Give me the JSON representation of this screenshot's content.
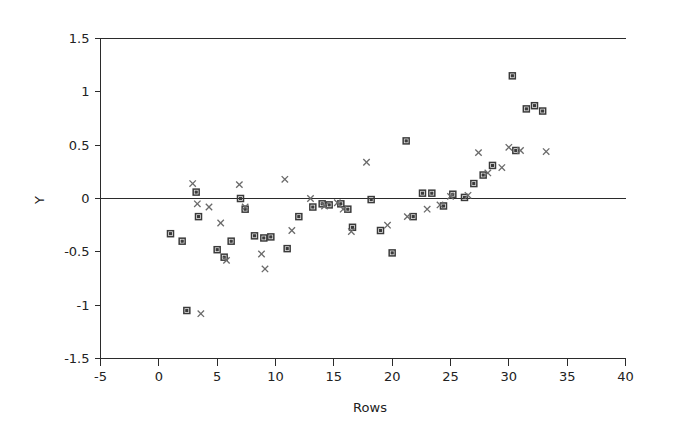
{
  "chart_data": {
    "type": "scatter",
    "title": "",
    "xlabel": "Rows",
    "ylabel": "Y",
    "xlim": [
      -5,
      40
    ],
    "ylim": [
      -1.5,
      1.5
    ],
    "xticks": [
      -5,
      0,
      5,
      10,
      15,
      20,
      25,
      30,
      35,
      40
    ],
    "xtick_labels": [
      "-5",
      "0",
      "5",
      "10",
      "15",
      "20",
      "25",
      "30",
      "35",
      "40"
    ],
    "yticks": [
      -1.5,
      -1,
      -0.5,
      0,
      0.5,
      1,
      1.5
    ],
    "ytick_labels": [
      "-1.5",
      "-1",
      "-0.5",
      "0",
      "0.5",
      "1",
      "1.5"
    ],
    "grid": false,
    "legend": "none",
    "reference_lines": [
      {
        "axis": "y",
        "value": 0,
        "style": "solid",
        "color": "#2b2b2b"
      }
    ],
    "marker_colors": {
      "square": "#3a3a3a",
      "cross": "#6a6a6a"
    },
    "series": [
      {
        "name": "squares",
        "marker": "square",
        "points": [
          [
            1.0,
            -0.33
          ],
          [
            2.0,
            -0.4
          ],
          [
            2.4,
            -1.05
          ],
          [
            3.2,
            0.06
          ],
          [
            3.4,
            -0.17
          ],
          [
            5.0,
            -0.48
          ],
          [
            5.6,
            -0.55
          ],
          [
            6.2,
            -0.4
          ],
          [
            7.0,
            0.0
          ],
          [
            7.4,
            -0.1
          ],
          [
            8.2,
            -0.35
          ],
          [
            9.0,
            -0.37
          ],
          [
            9.6,
            -0.36
          ],
          [
            11.0,
            -0.47
          ],
          [
            12.0,
            -0.17
          ],
          [
            13.2,
            -0.08
          ],
          [
            14.0,
            -0.05
          ],
          [
            14.6,
            -0.06
          ],
          [
            15.6,
            -0.05
          ],
          [
            16.2,
            -0.1
          ],
          [
            16.6,
            -0.27
          ],
          [
            18.2,
            -0.01
          ],
          [
            19.0,
            -0.3
          ],
          [
            20.0,
            -0.51
          ],
          [
            21.2,
            0.54
          ],
          [
            21.8,
            -0.17
          ],
          [
            22.6,
            0.05
          ],
          [
            23.4,
            0.05
          ],
          [
            24.4,
            -0.07
          ],
          [
            25.2,
            0.04
          ],
          [
            26.2,
            0.01
          ],
          [
            27.0,
            0.14
          ],
          [
            27.8,
            0.22
          ],
          [
            28.6,
            0.31
          ],
          [
            30.3,
            1.15
          ],
          [
            30.6,
            0.45
          ],
          [
            31.5,
            0.84
          ],
          [
            32.2,
            0.87
          ],
          [
            32.9,
            0.82
          ]
        ]
      },
      {
        "name": "crosses",
        "marker": "x",
        "points": [
          [
            2.9,
            0.14
          ],
          [
            3.3,
            -0.05
          ],
          [
            3.6,
            -1.08
          ],
          [
            4.3,
            -0.08
          ],
          [
            5.3,
            -0.23
          ],
          [
            5.8,
            -0.58
          ],
          [
            6.9,
            0.13
          ],
          [
            7.4,
            -0.08
          ],
          [
            8.8,
            -0.52
          ],
          [
            9.1,
            -0.66
          ],
          [
            10.8,
            0.18
          ],
          [
            11.4,
            -0.3
          ],
          [
            13.0,
            0.0
          ],
          [
            14.2,
            -0.07
          ],
          [
            15.3,
            -0.04
          ],
          [
            15.8,
            -0.1
          ],
          [
            16.5,
            -0.31
          ],
          [
            17.8,
            0.34
          ],
          [
            19.6,
            -0.25
          ],
          [
            21.3,
            -0.17
          ],
          [
            23.0,
            -0.1
          ],
          [
            24.1,
            -0.06
          ],
          [
            25.0,
            0.02
          ],
          [
            26.5,
            0.03
          ],
          [
            27.4,
            0.43
          ],
          [
            28.2,
            0.24
          ],
          [
            29.4,
            0.29
          ],
          [
            30.0,
            0.48
          ],
          [
            31.0,
            0.45
          ],
          [
            33.2,
            0.44
          ]
        ]
      }
    ]
  }
}
